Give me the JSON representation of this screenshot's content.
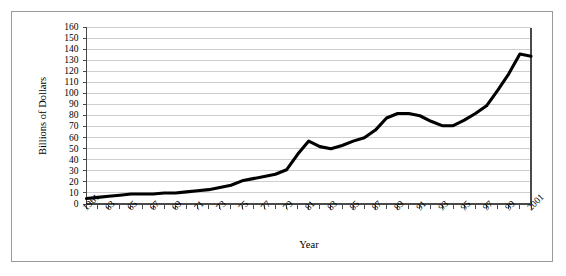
{
  "chart_data": {
    "type": "line",
    "title": "",
    "xlabel": "Year",
    "ylabel": "Billions of Dollars",
    "xlim": [
      1961,
      2001
    ],
    "ylim": [
      0,
      160
    ],
    "ytick_step": 10,
    "grid": true,
    "legend": null,
    "series_color": "#000000",
    "x": [
      1961,
      1962,
      1963,
      1964,
      1965,
      1966,
      1967,
      1968,
      1969,
      1970,
      1971,
      1972,
      1973,
      1974,
      1975,
      1976,
      1977,
      1978,
      1979,
      1980,
      1981,
      1982,
      1983,
      1984,
      1985,
      1986,
      1987,
      1988,
      1989,
      1990,
      1991,
      1992,
      1993,
      1994,
      1995,
      1996,
      1997,
      1998,
      1999,
      2000,
      2001
    ],
    "values": [
      5,
      6,
      7,
      8,
      9,
      9,
      9,
      10,
      10,
      11,
      12,
      13,
      15,
      17,
      21,
      23,
      25,
      27,
      31,
      45,
      57,
      52,
      50,
      53,
      57,
      60,
      67,
      78,
      82,
      82,
      80,
      75,
      71,
      71,
      76,
      82,
      89,
      103,
      118,
      136,
      134
    ],
    "ytick_labels": [
      "0",
      "10",
      "20",
      "30",
      "40",
      "50",
      "60",
      "70",
      "80",
      "90",
      "100",
      "110",
      "120",
      "130",
      "140",
      "150",
      "160"
    ],
    "xtick_labels": [
      "1961",
      "63",
      "65",
      "67",
      "69",
      "71",
      "73",
      "75",
      "77",
      "79",
      "81",
      "83",
      "85",
      "87",
      "89",
      "91",
      "93",
      "95",
      "97",
      "99",
      "2001"
    ]
  }
}
